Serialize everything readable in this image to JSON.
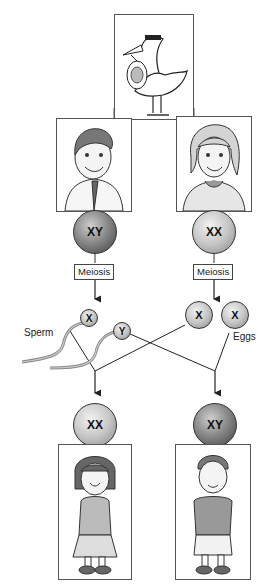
{
  "diagram": {
    "stork": {
      "icon": "stork-with-baby-icon"
    },
    "parents": {
      "father": {
        "icon": "father-portrait-icon",
        "chromosomes": "XY",
        "process_label": "Meiosis"
      },
      "mother": {
        "icon": "mother-portrait-icon",
        "chromosomes": "XX",
        "process_label": "Meiosis"
      }
    },
    "gametes": {
      "sperm_label": "Sperm",
      "sperm": [
        {
          "chromosome": "X"
        },
        {
          "chromosome": "Y"
        }
      ],
      "eggs_label": "Eggs",
      "eggs": [
        {
          "chromosome": "X"
        },
        {
          "chromosome": "X"
        }
      ]
    },
    "offspring": {
      "daughter": {
        "icon": "girl-portrait-icon",
        "chromosomes": "XX"
      },
      "son": {
        "icon": "boy-portrait-icon",
        "chromosomes": "XY"
      }
    }
  }
}
